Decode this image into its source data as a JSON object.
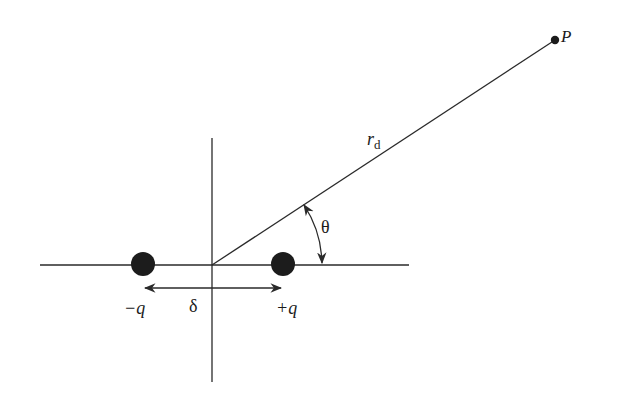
{
  "figure": {
    "colors": {
      "background": "#ffffff",
      "stroke": "#2a2a2a",
      "charge_fill": "#1c1c1c"
    },
    "origin": {
      "x": 212,
      "y": 265
    },
    "axes": {
      "horizontal": {
        "x1": 40,
        "x2": 409,
        "y": 265
      },
      "vertical": {
        "x": 212,
        "y1": 138,
        "y2": 382
      }
    },
    "charges": [
      {
        "id": "negative",
        "label": "−q",
        "cx": 143,
        "cy": 264,
        "r": 12
      },
      {
        "id": "positive",
        "label": "+q",
        "cx": 283,
        "cy": 264,
        "r": 12
      }
    ],
    "separation": {
      "label": "δ",
      "x1": 143,
      "x2": 283,
      "y": 288
    },
    "point": {
      "label": "P",
      "cx": 555,
      "cy": 40,
      "r": 4
    },
    "distance": {
      "label_main": "r",
      "label_sub": "d"
    },
    "angle": {
      "label": "θ",
      "radius": 110,
      "degrees": 33.3
    }
  }
}
